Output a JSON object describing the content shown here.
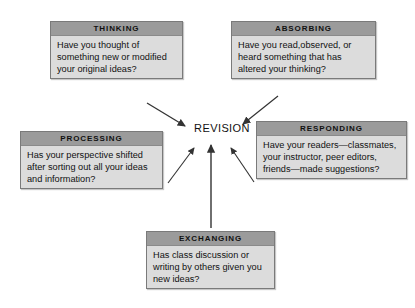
{
  "diagram": {
    "center": {
      "label": "REVISION"
    },
    "nodes": [
      {
        "id": "thinking",
        "title": "THINKING",
        "body": "Have you thought of something new or modified your original ideas?"
      },
      {
        "id": "absorbing",
        "title": "ABSORBING",
        "body": "Have you read,observed, or heard something that has altered your thinking?"
      },
      {
        "id": "processing",
        "title": "PROCESSING",
        "body": "Has your perspective shifted after sorting out all your ideas and information?"
      },
      {
        "id": "responding",
        "title": "RESPONDING",
        "body": "Have your readers—classmates, your instructor, peer editors, friends—made suggestions?"
      },
      {
        "id": "exchanging",
        "title": "EXCHANGING",
        "body": "Has class discussion or writing by others given you new ideas?"
      }
    ],
    "colors": {
      "header_fill": "#9b9b9b",
      "body_fill": "#dcdcdc",
      "border": "#7a7a7a",
      "arrow": "#333333",
      "text": "#111111",
      "background": "#ffffff"
    }
  }
}
